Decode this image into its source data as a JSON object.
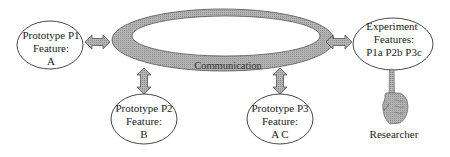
{
  "diagram": {
    "hub": {
      "label": "Communication",
      "fill": "#a9a9a9"
    },
    "nodes": {
      "p1": {
        "line1": "Prototype P1",
        "line2": "Feature:",
        "line3": "A"
      },
      "p2": {
        "line1": "Prototype P2",
        "line2": "Feature:",
        "line3": "B"
      },
      "p3": {
        "line1": "Prototype P3",
        "line2": "Feature:",
        "line3": "A C"
      },
      "experiment": {
        "line1": "Experiment",
        "line2": "Features:",
        "line3": "P1a P2b P3c"
      }
    },
    "actor": {
      "label": "Researcher",
      "icon": "pointing-hand-icon"
    },
    "connector_color": "#a6a6a6"
  }
}
